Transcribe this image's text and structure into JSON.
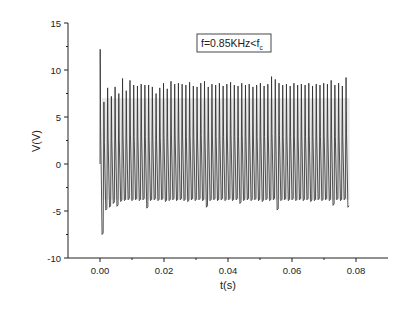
{
  "chart_data": {
    "type": "line",
    "title": "",
    "xlabel": "t(s)",
    "ylabel": "V(V)",
    "xlim": [
      -0.003,
      0.0895
    ],
    "ylim": [
      -10,
      15
    ],
    "x_ticks": [
      "0.00",
      "0.02",
      "0.04",
      "0.06",
      "0.08"
    ],
    "x_tick_values": [
      0,
      0.02,
      0.04,
      0.06,
      0.08
    ],
    "y_ticks": [
      "15",
      "10",
      "5",
      "0",
      "-5",
      "-10"
    ],
    "y_tick_values": [
      15,
      10,
      5,
      0,
      -5,
      -10
    ],
    "grid": false,
    "legend": null,
    "annotation": {
      "text": "f=0.85KHz<f",
      "subscript": "c",
      "boxed": true
    },
    "series": [
      {
        "name": "V(t)",
        "description": "Periodic spike train; initial spike to ~12.2 V then trough to ~-7.5 V, followed by ~67 spikes of ~8-9.3 V with troughs near -3.8 to -4.8 V",
        "t_start": 0.0,
        "t_end": 0.078,
        "spike_period": 0.00116,
        "initial_peak": 12.2,
        "initial_trough": -7.5,
        "typical_peak": 8.5,
        "typical_trough": -3.9,
        "peaks": [
          12.2,
          6.6,
          8.1,
          7.2,
          8.2,
          7.5,
          9.1,
          7.8,
          8.9,
          8.4,
          8.3,
          8.5,
          8.4,
          8.4,
          8.2,
          7.5,
          8.1,
          8.6,
          8.0,
          8.8,
          8.5,
          8.6,
          8.5,
          8.4,
          8.7,
          8.3,
          8.2,
          8.6,
          8.8,
          8.2,
          8.5,
          8.4,
          8.6,
          8.3,
          8.5,
          8.7,
          8.4,
          8.3,
          8.6,
          8.4,
          8.5,
          8.2,
          8.4,
          8.6,
          8.3,
          8.5,
          9.3,
          9.0,
          8.6,
          8.4,
          8.5,
          8.3,
          8.6,
          8.4,
          8.5,
          8.4,
          8.6,
          8.3,
          8.5,
          8.4,
          8.6,
          8.5,
          8.9,
          8.4,
          8.6,
          8.3,
          9.2
        ],
        "troughs": [
          -7.5,
          -4.9,
          -4.6,
          -4.2,
          -4.5,
          -4.0,
          -3.9,
          -3.8,
          -3.9,
          -3.8,
          -3.9,
          -3.8,
          -4.7,
          -3.9,
          -3.8,
          -3.9,
          -3.8,
          -4.0,
          -3.9,
          -3.8,
          -3.9,
          -3.8,
          -3.9,
          -4.0,
          -3.8,
          -3.9,
          -3.8,
          -3.9,
          -4.6,
          -3.9,
          -3.8,
          -3.9,
          -3.8,
          -3.9,
          -3.8,
          -3.9,
          -3.8,
          -4.2,
          -3.9,
          -3.8,
          -3.9,
          -3.8,
          -3.9,
          -4.0,
          -3.8,
          -3.9,
          -3.8,
          -4.9,
          -3.9,
          -3.8,
          -3.9,
          -3.8,
          -3.9,
          -3.8,
          -3.9,
          -3.8,
          -4.0,
          -3.9,
          -3.8,
          -3.9,
          -3.8,
          -3.9,
          -4.4,
          -3.8,
          -3.9,
          -3.8,
          -4.6
        ]
      }
    ]
  },
  "colors": {
    "line": "#2a2a2a",
    "fill": "#bdbdbd",
    "axis": "#222222"
  }
}
